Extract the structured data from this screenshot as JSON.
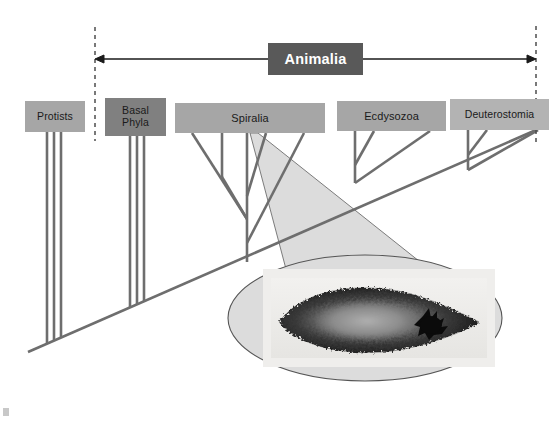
{
  "diagram": {
    "banner": {
      "label": "Animalia"
    },
    "clades": [
      {
        "id": "protists",
        "label": "Protists",
        "color": "#a6a6a6",
        "tips": 3
      },
      {
        "id": "basal-phyla",
        "label": "Basal\nPhyla",
        "color": "#808080",
        "tips": 3
      },
      {
        "id": "spiralia",
        "label": "Spiralia",
        "color": "#a6a6a6",
        "tips": 5
      },
      {
        "id": "ecdysozoa",
        "label": "Ecdysozoa",
        "color": "#a6a6a6",
        "tips": 3
      },
      {
        "id": "deuterostomia",
        "label": "Deuterostomia",
        "color": "#b3b3b3",
        "tips": 3
      }
    ],
    "annotations": {
      "left_boundary": "dashed-divider-left",
      "right_boundary": "dashed-divider-right",
      "range_arrow": "double-headed-arrow-spanning-animalia",
      "callout": "magnifier-cone-from-spiralia",
      "callout_subject": "flatworm-photograph"
    },
    "colors": {
      "branch": "#6e6e6e",
      "banner_bg": "#595959",
      "banner_text": "#ffffff",
      "dashed_line": "#4d4d4d",
      "callout_fill": "#dcdcdc",
      "callout_stroke": "#555555",
      "background": "#ffffff"
    }
  }
}
